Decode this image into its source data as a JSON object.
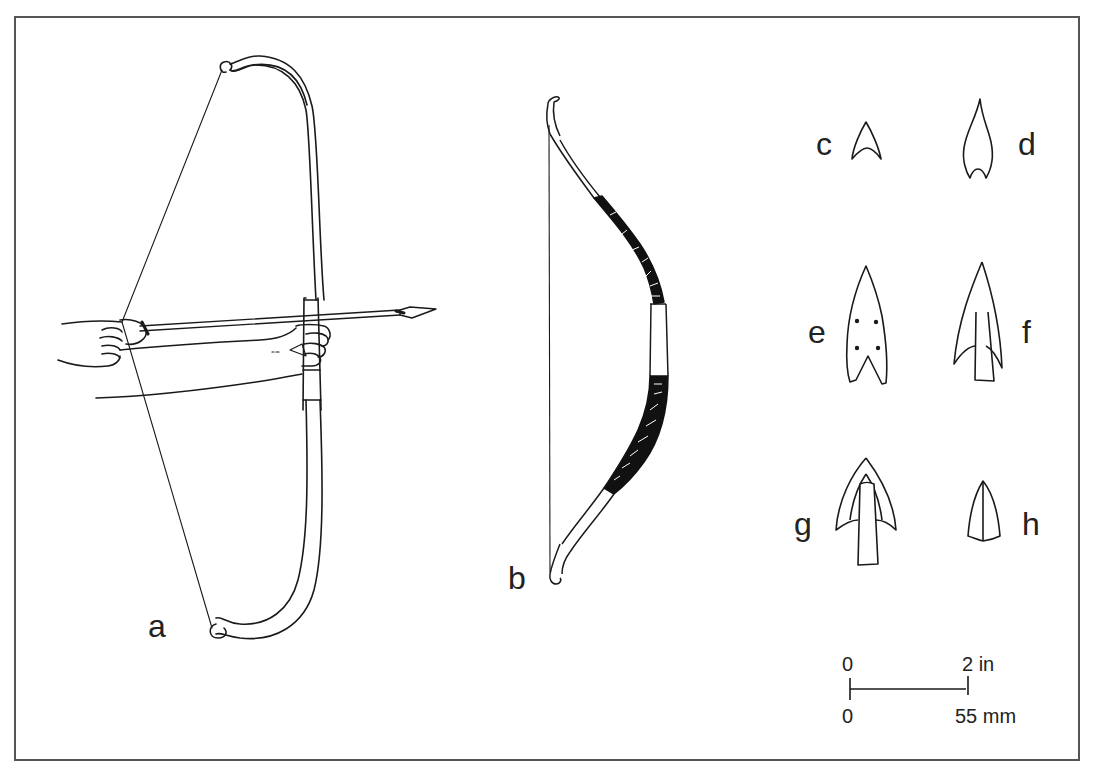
{
  "figure": {
    "labels": {
      "a": "a",
      "b": "b",
      "c": "c",
      "d": "d",
      "e": "e",
      "f": "f",
      "g": "g",
      "h": "h"
    },
    "scale_bar": {
      "top_start": "0",
      "top_end": "2 in",
      "bottom_start": "0",
      "bottom_end": "55 mm"
    },
    "colors": {
      "line": "#1a1a1a",
      "frame": "#555555",
      "background": "#ffffff",
      "wrapping": "#111111"
    }
  }
}
